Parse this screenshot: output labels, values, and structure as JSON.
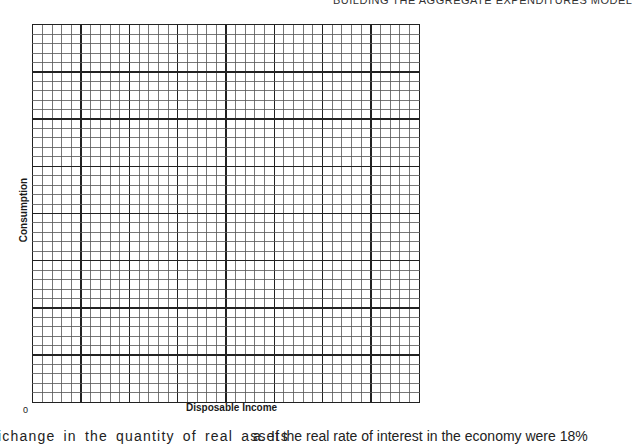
{
  "page": {
    "running_header": "BUILDING THE AGGREGATE EXPENDITURES MODEL"
  },
  "chart_data": {
    "type": "line",
    "title": "",
    "xlabel": "Disposable Income",
    "ylabel": "Consumption",
    "origin_label": "0",
    "grid": true,
    "grid_spec": {
      "major_columns": 8,
      "major_rows": 8,
      "minor_per_major": 5
    },
    "series": [],
    "note": "Blank graph paper grid for student plotting; no data plotted"
  },
  "body_text": {
    "left_column_fragment": "ichange in the quantity of real assets",
    "right_column_item_number": "a.",
    "right_column_fragment": "If the real rate of interest in the economy were 18%"
  },
  "colors": {
    "grid_minor": "#555555",
    "grid_major": "#222222",
    "text": "#1a1a1a"
  }
}
